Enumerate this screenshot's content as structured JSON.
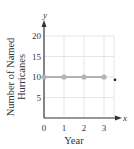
{
  "chart_data": {
    "type": "line",
    "title": "",
    "xlabel": "Year",
    "ylabel": "Number of Named Hurricanes",
    "ylabel_lines": [
      "Number of Named",
      "Hurricanes"
    ],
    "x_var": "x",
    "y_var": "y",
    "xlim": [
      0,
      3.5
    ],
    "ylim": [
      0,
      20
    ],
    "x_ticks": [
      0,
      1,
      2,
      3
    ],
    "y_ticks": [
      5,
      10,
      15,
      20
    ],
    "x_tick_labels": [
      "0",
      "1",
      "2",
      "3"
    ],
    "y_tick_labels": [
      "5",
      "10",
      "15",
      "20"
    ],
    "grid": true,
    "legend": null,
    "series": [
      {
        "name": "Named Hurricanes",
        "x": [
          0,
          1,
          2,
          3
        ],
        "y": [
          10,
          10,
          10,
          10
        ],
        "color": "#b3b3b3",
        "marker": "circle"
      }
    ],
    "annotations": [
      {
        "type": "dot",
        "x": 3.55,
        "y": 9.3,
        "color": "#222222"
      }
    ]
  },
  "colors": {
    "axis": "#333333",
    "grid": "#e6e6e6",
    "series": "#b3b3b3",
    "text": "#333333"
  }
}
